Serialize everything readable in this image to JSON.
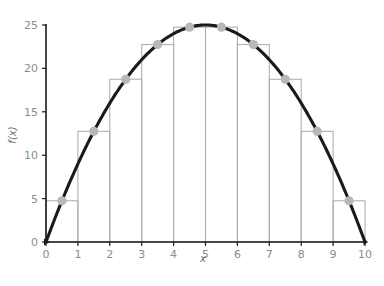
{
  "chart_data": {
    "type": "bar",
    "title": "",
    "subtitle": "",
    "xlabel": "x",
    "ylabel": "f(x)",
    "xlim": [
      0,
      10
    ],
    "ylim": [
      0,
      25
    ],
    "grid": false,
    "legend": null,
    "x_ticks": [
      0,
      1,
      2,
      3,
      4,
      5,
      6,
      7,
      8,
      9,
      10
    ],
    "x_tick_labels": [
      "0",
      "1",
      "2",
      "3",
      "4",
      "5",
      "6",
      "7",
      "8",
      "9",
      "10"
    ],
    "y_ticks": [
      0,
      5,
      10,
      15,
      20,
      25
    ],
    "y_tick_labels": [
      "0",
      "5",
      "10",
      "15",
      "20",
      "25"
    ],
    "categories": [
      "0-1",
      "1-2",
      "2-3",
      "3-4",
      "4-5",
      "5-6",
      "6-7",
      "7-8",
      "8-9",
      "9-10"
    ],
    "values": [
      4.75,
      12.75,
      18.75,
      22.75,
      24.75,
      24.75,
      22.75,
      18.75,
      12.75,
      4.75
    ],
    "bar_left_edges": [
      0,
      1,
      2,
      3,
      4,
      5,
      6,
      7,
      8,
      9
    ],
    "bar_width": 1,
    "midpoints": [
      0.5,
      1.5,
      2.5,
      3.5,
      4.5,
      5.5,
      6.5,
      7.5,
      8.5,
      9.5
    ],
    "series": [
      {
        "name": "midpoint-rectangles",
        "type": "bar",
        "values": [
          4.75,
          12.75,
          18.75,
          22.75,
          24.75,
          24.75,
          22.75,
          18.75,
          12.75,
          4.75
        ]
      },
      {
        "name": "f(x) = x(10 - x)",
        "type": "line",
        "x": [
          0,
          0.5,
          1,
          1.5,
          2,
          2.5,
          3,
          3.5,
          4,
          4.5,
          5,
          5.5,
          6,
          6.5,
          7,
          7.5,
          8,
          8.5,
          9,
          9.5,
          10
        ],
        "values": [
          0,
          4.75,
          9,
          12.75,
          16,
          18.75,
          21,
          22.75,
          24,
          24.75,
          25,
          24.75,
          24,
          22.75,
          21,
          18.75,
          16,
          12.75,
          9,
          4.75,
          0
        ]
      },
      {
        "name": "midpoint-markers",
        "type": "scatter",
        "x": [
          0.5,
          1.5,
          2.5,
          3.5,
          4.5,
          5.5,
          6.5,
          7.5,
          8.5,
          9.5
        ],
        "values": [
          4.75,
          12.75,
          18.75,
          22.75,
          24.75,
          24.75,
          22.75,
          18.75,
          12.75,
          4.75
        ]
      }
    ]
  },
  "colors": {
    "curve": "#1a1a1a",
    "bar_outline": "#b0b0b0",
    "marker": "#b8b8b8",
    "axis": "#1a1a1a",
    "tick_text": "#8c8c8c",
    "axis_title": "#6e6e6e",
    "background": "#ffffff"
  }
}
